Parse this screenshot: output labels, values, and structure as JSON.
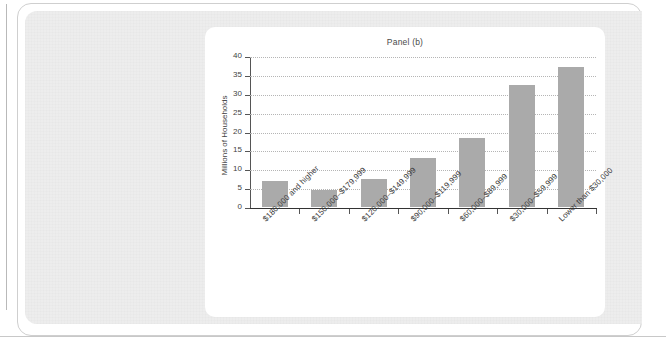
{
  "figure": {
    "card_title": "Panel (b)"
  },
  "chart_data": {
    "type": "bar",
    "title": "Panel (b)",
    "xlabel": "",
    "ylabel": "Millions of Households",
    "ylim": [
      0,
      40
    ],
    "ytick_labels": [
      "0",
      "5",
      "10",
      "15",
      "20",
      "25",
      "30",
      "35",
      "40"
    ],
    "ytick_values": [
      0,
      5,
      10,
      15,
      20,
      25,
      30,
      35,
      40
    ],
    "grid": true,
    "legend": null,
    "bar_color": "#aaaaaa",
    "categories": [
      "$180,000 and higher",
      "$150,000–$179,999",
      "$120,000–$149,999",
      "$90,000–$119,999",
      "$60,000–$89,999",
      "$30,000–$59,999",
      "Lower than $30,000"
    ],
    "values": [
      7.0,
      4.4,
      7.4,
      13.0,
      18.2,
      32.4,
      37.0
    ]
  }
}
